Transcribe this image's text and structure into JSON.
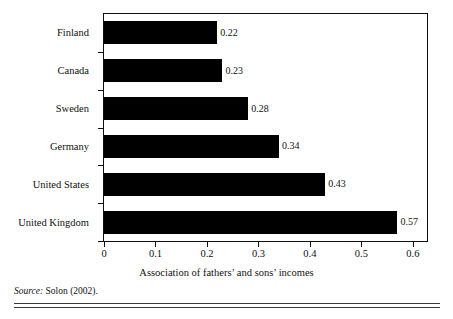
{
  "figure": {
    "title_remnant": "",
    "source_label": "Source:",
    "source_text": " Solon (2002)."
  },
  "chart_data": {
    "type": "bar",
    "orientation": "horizontal",
    "title": "",
    "xlabel": "Association of fathers’ and sons’ incomes",
    "ylabel": "",
    "categories": [
      "Finland",
      "Canada",
      "Sweden",
      "Germany",
      "United States",
      "United Kingdom"
    ],
    "values": [
      0.22,
      0.23,
      0.28,
      0.34,
      0.43,
      0.57
    ],
    "value_labels": [
      "0.22",
      "0.23",
      "0.28",
      "0.34",
      "0.43",
      "0.57"
    ],
    "xlim": [
      0,
      0.6274
    ],
    "xticks": [
      0,
      0.1,
      0.2,
      0.3,
      0.4,
      0.5,
      0.6
    ],
    "xticklabels": [
      "0",
      "0.1",
      "0.2",
      "0.3",
      "0.4",
      "0.5",
      "0.6"
    ],
    "grid": false,
    "legend": "none",
    "bar_color": "#000000",
    "frame_color": "#101010",
    "background_color": "#ffffff",
    "source": "Source: Solon (2002)."
  }
}
